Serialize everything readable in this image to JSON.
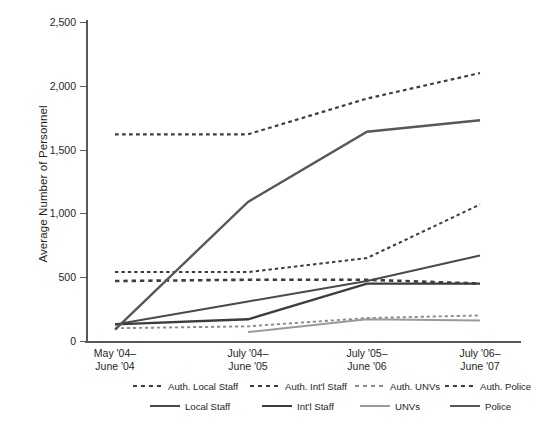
{
  "chart_data": {
    "type": "line",
    "title": "",
    "xlabel": "",
    "ylabel": "Average Number of Personnel",
    "ylim": [
      0,
      2500
    ],
    "yticks": [
      0,
      500,
      1000,
      1500,
      2000,
      2500
    ],
    "ytick_labels": [
      "0",
      "500",
      "1,000",
      "1,500",
      "2,000",
      "2,500"
    ],
    "grid": false,
    "legend_position": "bottom",
    "categories": [
      "May '04–June '04",
      "July '04–June '05",
      "July '05–June '06",
      "July '06–June '07"
    ],
    "category_lines": [
      [
        "May '04–",
        "June '04"
      ],
      [
        "July '04–",
        "June '05"
      ],
      [
        "July '05–",
        "June '06"
      ],
      [
        "July '06–",
        "June '07"
      ]
    ],
    "series": [
      {
        "name": "Auth. Local Staff",
        "style": "dashed",
        "color": "#3d3d3f",
        "width": 2.0,
        "values": [
          540,
          540,
          650,
          1070
        ]
      },
      {
        "name": "Auth. Int'l  Staff",
        "style": "dashed",
        "color": "#3d3d3f",
        "width": 2.6,
        "values": [
          470,
          480,
          480,
          450
        ]
      },
      {
        "name": "Auth. UNVs",
        "style": "dashed",
        "color": "#8c8c8e",
        "width": 1.9,
        "values": [
          100,
          115,
          180,
          200
        ]
      },
      {
        "name": "Auth. Police",
        "style": "dashed",
        "color": "#3d3d3f",
        "width": 2.2,
        "values": [
          1620,
          1620,
          1900,
          2100
        ]
      },
      {
        "name": "Local Staff",
        "style": "solid",
        "color": "#4a4a4c",
        "width": 2.0,
        "values": [
          130,
          310,
          470,
          670
        ]
      },
      {
        "name": "Int'l Staff",
        "style": "solid",
        "color": "#3d3d3f",
        "width": 2.4,
        "values": [
          130,
          170,
          450,
          450
        ]
      },
      {
        "name": "UNVs",
        "style": "solid",
        "color": "#9a9a9c",
        "width": 2.0,
        "values": [
          null,
          70,
          170,
          160
        ]
      },
      {
        "name": "Police",
        "style": "solid",
        "color": "#58585b",
        "width": 2.4,
        "values": [
          90,
          1090,
          1640,
          1730
        ]
      }
    ],
    "legend_rows": [
      [
        "Auth. Local Staff",
        "Auth. Int'l  Staff",
        "Auth. UNVs",
        "Auth. Police"
      ],
      [
        "Local Staff",
        "Int'l Staff",
        "UNVs",
        "Police"
      ]
    ]
  },
  "axis": {
    "line_color": "#58585b"
  }
}
